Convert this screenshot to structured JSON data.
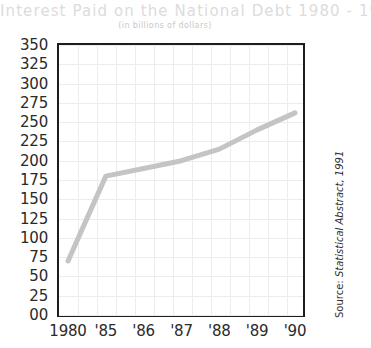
{
  "title": "Interest Paid on the National Debt 1980 - 1990",
  "subtitle": "(in billions of dollars)",
  "source_prefix": "Source: ",
  "source_text": "Statistical Abstract, 1991",
  "colors": {
    "line": "#c4c4c4",
    "frame": "#1d1d1d",
    "grid": "#ececec",
    "title": "#dcdcdc",
    "axis_text": "#2a2a2a"
  },
  "chart_data": {
    "type": "line",
    "title": "Interest Paid on the National Debt 1980 - 1990",
    "subtitle": "(in billions of dollars)",
    "xlabel": "",
    "ylabel": "",
    "categories": [
      "1980",
      "'85",
      "'86",
      "'87",
      "'88",
      "'89",
      "'90"
    ],
    "values": [
      70,
      180,
      190,
      200,
      215,
      240,
      262
    ],
    "series": [
      {
        "name": "Interest Paid",
        "values": [
          70,
          180,
          190,
          200,
          215,
          240,
          262
        ]
      }
    ],
    "ylim": [
      0,
      350
    ],
    "ytick_labels": [
      "350",
      "325",
      "300",
      "275",
      "250",
      "225",
      "200",
      "175",
      "150",
      "125",
      "100",
      "75",
      "50",
      "25",
      "00"
    ],
    "ytick_values": [
      350,
      325,
      300,
      275,
      250,
      225,
      200,
      175,
      150,
      125,
      100,
      75,
      50,
      25,
      0
    ],
    "xtick_labels": [
      "1980",
      "'85",
      "'86",
      "'87",
      "'88",
      "'89",
      "'90"
    ],
    "grid": true,
    "legend": "none",
    "source": "Source: Statistical Abstract, 1991"
  }
}
